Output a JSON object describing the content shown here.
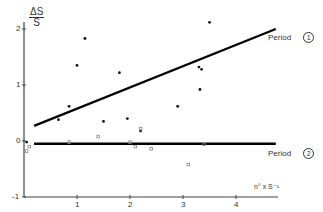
{
  "chart_data": {
    "type": "scatter",
    "title": "",
    "xlabel": "n° x S⁻¹",
    "ylabel": "ΔS / S",
    "ylabel_num": "ΔS",
    "ylabel_den": "S",
    "xlim": [
      0,
      4.7
    ],
    "ylim": [
      -1,
      2.3
    ],
    "x_ticks": [
      1,
      2,
      3,
      4
    ],
    "y_ticks": [
      -1,
      0,
      1,
      2
    ],
    "x_tick_labels": [
      "1",
      "2",
      "3",
      "4"
    ],
    "y_tick_labels": [
      "-1",
      "0",
      "1",
      "2"
    ],
    "grid": false,
    "series": [
      {
        "name": "Period 1",
        "label": "Period",
        "marker_label": "1",
        "marker": "filled-dot",
        "color": "#111111",
        "points": [
          [
            0.05,
            -0.02
          ],
          [
            0.65,
            0.38
          ],
          [
            0.85,
            0.62
          ],
          [
            1.0,
            1.35
          ],
          [
            1.15,
            1.83
          ],
          [
            1.5,
            0.35
          ],
          [
            1.8,
            1.22
          ],
          [
            1.95,
            0.4
          ],
          [
            2.2,
            0.18
          ],
          [
            2.9,
            0.62
          ],
          [
            3.3,
            1.32
          ],
          [
            3.35,
            1.28
          ],
          [
            3.32,
            0.92
          ],
          [
            3.5,
            2.12
          ]
        ],
        "fit_line": [
          [
            0.19,
            0.27
          ],
          [
            4.75,
            2.0
          ]
        ]
      },
      {
        "name": "Period 2",
        "label": "Period",
        "marker_label": "2",
        "marker": "open-square",
        "color": "#888888",
        "points": [
          [
            0.05,
            -0.18
          ],
          [
            0.1,
            -0.1
          ],
          [
            0.85,
            -0.02
          ],
          [
            1.4,
            0.08
          ],
          [
            2.0,
            -0.02
          ],
          [
            2.1,
            -0.1
          ],
          [
            2.2,
            0.22
          ],
          [
            2.4,
            -0.14
          ],
          [
            3.1,
            -0.42
          ],
          [
            3.4,
            -0.06
          ]
        ],
        "fit_line": [
          [
            0.19,
            -0.05
          ],
          [
            4.75,
            -0.05
          ]
        ]
      }
    ],
    "legend_position": "inline-right"
  }
}
